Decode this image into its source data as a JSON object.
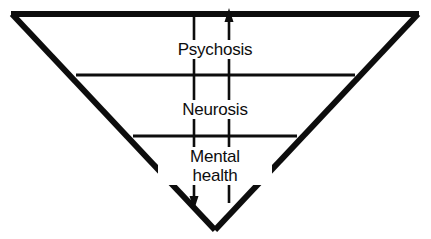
{
  "figure": {
    "stroke_color": "#0d0d0d",
    "background_color": "#ffffff",
    "bands": [
      {
        "id": "psychosis",
        "label": "Psychosis",
        "order": 1,
        "position": "top"
      },
      {
        "id": "neurosis",
        "label": "Neurosis",
        "order": 2,
        "position": "middle"
      },
      {
        "id": "mental-health",
        "label": "Mental\nhealth",
        "order": 3,
        "position": "bottom"
      }
    ],
    "axes": [
      {
        "id": "left-axis",
        "direction": "down",
        "arrowhead": "bottom"
      },
      {
        "id": "right-axis",
        "direction": "up",
        "arrowhead": "top"
      }
    ]
  }
}
